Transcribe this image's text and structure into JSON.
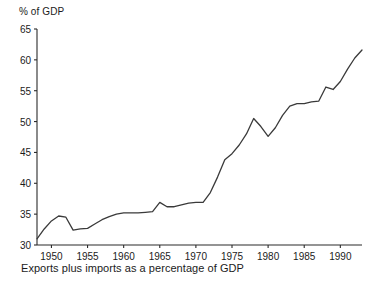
{
  "chart_data": {
    "type": "line",
    "title": "",
    "ylabel": "% of GDP",
    "xlabel": "",
    "caption": "Exports plus imports as a percentage of GDP",
    "ylim": [
      30,
      65
    ],
    "xlim": [
      1948,
      1993
    ],
    "grid": false,
    "legend": null,
    "y_ticks": [
      30,
      35,
      40,
      45,
      50,
      55,
      60,
      65
    ],
    "y_tick_labels": [
      "30",
      "35",
      "40",
      "45",
      "50",
      "55",
      "60",
      "65"
    ],
    "x_ticks": [
      1950,
      1955,
      1960,
      1965,
      1970,
      1975,
      1980,
      1985,
      1990
    ],
    "x_tick_labels": [
      "1950",
      "1955",
      "1960",
      "1965",
      "1970",
      "1975",
      "1980",
      "1985",
      "1990"
    ],
    "line_color": "#3a3a3a",
    "series": [
      {
        "name": "Exports plus imports as a percentage of GDP",
        "x": [
          1948,
          1949,
          1950,
          1951,
          1952,
          1953,
          1954,
          1955,
          1956,
          1957,
          1958,
          1959,
          1960,
          1961,
          1962,
          1963,
          1964,
          1965,
          1966,
          1967,
          1968,
          1969,
          1970,
          1971,
          1972,
          1973,
          1974,
          1975,
          1976,
          1977,
          1978,
          1979,
          1980,
          1981,
          1982,
          1983,
          1984,
          1985,
          1986,
          1987,
          1988,
          1989,
          1990,
          1991,
          1992,
          1993
        ],
        "values": [
          31.0,
          32.6,
          33.9,
          34.7,
          34.5,
          32.4,
          32.6,
          32.7,
          33.4,
          34.1,
          34.6,
          35.0,
          35.2,
          35.2,
          35.2,
          35.3,
          35.4,
          36.9,
          36.2,
          36.2,
          36.5,
          36.8,
          36.9,
          36.9,
          38.5,
          41.0,
          43.8,
          44.8,
          46.2,
          48.0,
          50.5,
          49.2,
          47.6,
          49.0,
          51.0,
          52.5,
          52.9,
          52.9,
          53.2,
          53.3,
          55.6,
          55.2,
          56.5,
          58.5,
          60.3,
          61.6
        ]
      }
    ]
  }
}
